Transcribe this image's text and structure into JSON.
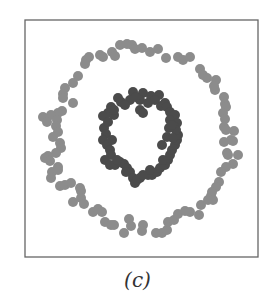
{
  "caption": "(c)",
  "colors": {
    "outer_ring": "#8c8c8c",
    "inner_ring": "#4b4b4b",
    "frame": "#666666",
    "background": "#ffffff"
  },
  "chart_data": {
    "type": "scatter",
    "title": "",
    "caption": "(c)",
    "xlabel": "",
    "ylabel": "",
    "grid": false,
    "axes_ticks": false,
    "legend": null,
    "frame_px": {
      "x0": 25,
      "y0": 20,
      "x1": 258,
      "y1": 257
    },
    "marker_radius_px": 5,
    "series": [
      {
        "name": "outer ring (class 1)",
        "color": "#8c8c8c",
        "points_px": [
          [
            86,
            60
          ],
          [
            89,
            57
          ],
          [
            100,
            55
          ],
          [
            103,
            57
          ],
          [
            112,
            52
          ],
          [
            115,
            56
          ],
          [
            120,
            45
          ],
          [
            127,
            44
          ],
          [
            132,
            45
          ],
          [
            135,
            49
          ],
          [
            142,
            48
          ],
          [
            150,
            52
          ],
          [
            158,
            49
          ],
          [
            166,
            58
          ],
          [
            178,
            57
          ],
          [
            183,
            60
          ],
          [
            190,
            57
          ],
          [
            85,
            64
          ],
          [
            78,
            76
          ],
          [
            73,
            83
          ],
          [
            65,
            88
          ],
          [
            63,
            94
          ],
          [
            63,
            98
          ],
          [
            73,
            103
          ],
          [
            62,
            111
          ],
          [
            58,
            113
          ],
          [
            51,
            115
          ],
          [
            43,
            117
          ],
          [
            47,
            122
          ],
          [
            57,
            120
          ],
          [
            56,
            126
          ],
          [
            58,
            132
          ],
          [
            53,
            137
          ],
          [
            60,
            143
          ],
          [
            61,
            148
          ],
          [
            56,
            153
          ],
          [
            48,
            156
          ],
          [
            45,
            158
          ],
          [
            50,
            161
          ],
          [
            58,
            167
          ],
          [
            52,
            172
          ],
          [
            58,
            170
          ],
          [
            51,
            178
          ],
          [
            60,
            186
          ],
          [
            65,
            185
          ],
          [
            71,
            183
          ],
          [
            80,
            188
          ],
          [
            81,
            191
          ],
          [
            73,
            202
          ],
          [
            81,
            198
          ],
          [
            84,
            204
          ],
          [
            93,
            212
          ],
          [
            98,
            209
          ],
          [
            102,
            212
          ],
          [
            105,
            222
          ],
          [
            111,
            225
          ],
          [
            114,
            225
          ],
          [
            129,
            219
          ],
          [
            131,
            226
          ],
          [
            124,
            233
          ],
          [
            143,
            225
          ],
          [
            142,
            231
          ],
          [
            156,
            233
          ],
          [
            162,
            233
          ],
          [
            167,
            230
          ],
          [
            168,
            222
          ],
          [
            174,
            220
          ],
          [
            178,
            214
          ],
          [
            185,
            211
          ],
          [
            190,
            212
          ],
          [
            199,
            215
          ],
          [
            201,
            205
          ],
          [
            208,
            200
          ],
          [
            211,
            196
          ],
          [
            200,
            69
          ],
          [
            203,
            75
          ],
          [
            207,
            78
          ],
          [
            216,
            80
          ],
          [
            215,
            90
          ],
          [
            214,
            86
          ],
          [
            224,
            97
          ],
          [
            225,
            104
          ],
          [
            226,
            107
          ],
          [
            223,
            113
          ],
          [
            225,
            119
          ],
          [
            224,
            127
          ],
          [
            226,
            130
          ],
          [
            234,
            131
          ],
          [
            231,
            140
          ],
          [
            233,
            141
          ],
          [
            224,
            142
          ],
          [
            227,
            153
          ],
          [
            228,
            155
          ],
          [
            238,
            155
          ],
          [
            233,
            164
          ],
          [
            226,
            167
          ],
          [
            221,
            172
          ],
          [
            219,
            182
          ],
          [
            216,
            187
          ],
          [
            212,
            192
          ],
          [
            213,
            200
          ]
        ]
      },
      {
        "name": "inner ring (class 2)",
        "color": "#4b4b4b",
        "points_px": [
          [
            133,
            92
          ],
          [
            143,
            93
          ],
          [
            151,
            96
          ],
          [
            159,
            95
          ],
          [
            130,
            100
          ],
          [
            140,
            100
          ],
          [
            148,
            103
          ],
          [
            118,
            98
          ],
          [
            121,
            102
          ],
          [
            125,
            105
          ],
          [
            111,
            107
          ],
          [
            108,
            113
          ],
          [
            103,
            116
          ],
          [
            114,
            115
          ],
          [
            140,
            110
          ],
          [
            143,
            113
          ],
          [
            161,
            106
          ],
          [
            165,
            103
          ],
          [
            167,
            107
          ],
          [
            170,
            112
          ],
          [
            175,
            115
          ],
          [
            170,
            120
          ],
          [
            177,
            123
          ],
          [
            175,
            127
          ],
          [
            104,
            128
          ],
          [
            106,
            134
          ],
          [
            103,
            140
          ],
          [
            107,
            145
          ],
          [
            110,
            150
          ],
          [
            111,
            155
          ],
          [
            105,
            160
          ],
          [
            110,
            165
          ],
          [
            115,
            165
          ],
          [
            120,
            162
          ],
          [
            124,
            164
          ],
          [
            127,
            168
          ],
          [
            130,
            172
          ],
          [
            133,
            178
          ],
          [
            135,
            183
          ],
          [
            137,
            180
          ],
          [
            140,
            178
          ],
          [
            143,
            175
          ],
          [
            148,
            175
          ],
          [
            152,
            175
          ],
          [
            157,
            172
          ],
          [
            160,
            168
          ],
          [
            165,
            165
          ],
          [
            168,
            160
          ],
          [
            170,
            155
          ],
          [
            172,
            150
          ],
          [
            175,
            145
          ],
          [
            177,
            140
          ],
          [
            178,
            135
          ],
          [
            176,
            130
          ],
          [
            162,
            145
          ],
          [
            167,
            137
          ],
          [
            169,
            128
          ],
          [
            172,
            125
          ],
          [
            108,
            122
          ],
          [
            112,
            140
          ],
          [
            117,
            160
          ],
          [
            126,
            172
          ],
          [
            150,
            170
          ],
          [
            163,
            160
          ],
          [
            173,
            138
          ],
          [
            155,
            100
          ],
          [
            136,
            97
          ],
          [
            114,
            110
          ]
        ]
      }
    ]
  }
}
